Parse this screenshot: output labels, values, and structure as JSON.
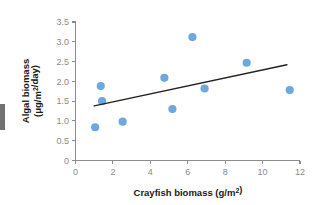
{
  "chart_data": {
    "type": "scatter",
    "title": "",
    "xlabel": "Crayfish biomass (g/m²)",
    "ylabel": "Algal biomass (μg/m²/day)",
    "ylabel_line1": "Algal biomass",
    "ylabel_line2": "(μg/m²/day)",
    "xlim": [
      0,
      12
    ],
    "ylim": [
      0,
      3.5
    ],
    "xticks": [
      0,
      2,
      4,
      6,
      8,
      10,
      12
    ],
    "xtick_labels": [
      "0",
      "2",
      "4",
      "6",
      "8",
      "10",
      "12"
    ],
    "yticks": [
      0,
      0.5,
      1.0,
      1.5,
      2.0,
      2.5,
      3.0,
      3.5
    ],
    "ytick_labels": [
      "0",
      "0.5",
      "1.0",
      "1.5",
      "2.0",
      "2.5",
      "3.0",
      "3.5"
    ],
    "grid": false,
    "legend": false,
    "point_color": "#6fa8dc",
    "line_color": "#25221f",
    "axis_color": "#8c8c8c",
    "tick_label_color": "#8a8a8a",
    "points": [
      {
        "x": 1.05,
        "y": 0.84
      },
      {
        "x": 1.35,
        "y": 1.88
      },
      {
        "x": 1.42,
        "y": 1.5
      },
      {
        "x": 2.52,
        "y": 0.98
      },
      {
        "x": 4.75,
        "y": 2.09
      },
      {
        "x": 5.18,
        "y": 1.3
      },
      {
        "x": 6.25,
        "y": 3.12
      },
      {
        "x": 6.9,
        "y": 1.82
      },
      {
        "x": 9.15,
        "y": 2.47
      },
      {
        "x": 11.45,
        "y": 1.78
      }
    ],
    "trend_line": {
      "x0": 1.0,
      "y0": 1.38,
      "x1": 11.3,
      "y1": 2.42
    }
  }
}
